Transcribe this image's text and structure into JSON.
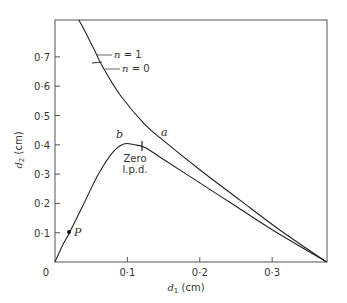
{
  "chart_data": {
    "type": "line",
    "title": "",
    "xlabel": "d1 (cm)",
    "ylabel": "d2 (cm)",
    "xlim": [
      0,
      0.378
    ],
    "ylim": [
      0,
      0.826
    ],
    "grid": false,
    "legend": "none",
    "x_ticks": [
      0,
      0.1,
      0.2,
      0.3
    ],
    "x_tick_labels": [
      "0",
      "0·1",
      "0·2",
      "0·3"
    ],
    "y_ticks": [
      0.1,
      0.2,
      0.3,
      0.4,
      0.5,
      0.6,
      0.7
    ],
    "y_tick_labels": [
      "0·1",
      "0·2",
      "0·3",
      "0·4",
      "0·5",
      "0·6",
      "0·7"
    ],
    "series": [
      {
        "name": "a",
        "x": [
          0.033,
          0.045,
          0.057,
          0.065,
          0.09,
          0.124,
          0.152,
          0.2,
          0.255,
          0.31,
          0.375
        ],
        "y": [
          0.826,
          0.77,
          0.71,
          0.67,
          0.57,
          0.47,
          0.41,
          0.315,
          0.212,
          0.11,
          0.0
        ]
      },
      {
        "name": "b",
        "x": [
          0.0,
          0.01,
          0.02,
          0.04,
          0.06,
          0.08,
          0.095,
          0.11,
          0.125,
          0.15,
          0.2,
          0.25,
          0.3,
          0.375
        ],
        "y": [
          0.0,
          0.055,
          0.1,
          0.2,
          0.3,
          0.375,
          0.403,
          0.4,
          0.39,
          0.35,
          0.27,
          0.19,
          0.11,
          0.0
        ]
      }
    ],
    "annotations": [
      {
        "text": "a",
        "x": 0.16,
        "y": 0.44,
        "target": "curve a label"
      },
      {
        "text": "b",
        "x": 0.088,
        "y": 0.42,
        "target": "curve b label"
      },
      {
        "text": "n = 1",
        "x": 0.057,
        "y": 0.71,
        "target": "tick on curve a"
      },
      {
        "text": "n = 0",
        "x": 0.06,
        "y": 0.68,
        "target": "tick on curve a"
      },
      {
        "text": "Zero l.p.d.",
        "x": 0.125,
        "y": 0.39,
        "target": "marker on curve b"
      },
      {
        "text": "P",
        "x": 0.02,
        "y": 0.1,
        "target": "point on curve b"
      }
    ]
  },
  "labels": {
    "xlabel_var": "d",
    "xlabel_sub": "1",
    "xlabel_unit": " (cm)",
    "ylabel_var": "d",
    "ylabel_sub": "2",
    "ylabel_unit": " (cm)",
    "origin": "0",
    "curve_a": "a",
    "curve_b": "b",
    "n1": "n = 1",
    "n0": "n = 0",
    "zero_line1": "Zero",
    "zero_line2": "l.p.d.",
    "point_p": "P"
  }
}
